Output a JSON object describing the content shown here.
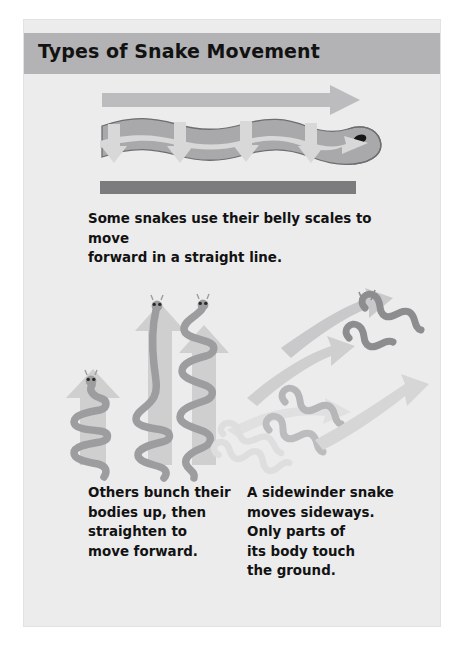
{
  "page": {
    "background_color": "#ececed",
    "outer_background_color": "#ffffff"
  },
  "header": {
    "title": "Types of Snake Movement",
    "band_color": "#b3b3b5",
    "title_color": "#121212"
  },
  "figures": [
    {
      "id": "straight-line-movement",
      "name": "snake-straight-line-diagram",
      "description": "Side view of a snake lying on the ground, with a long horizontal arrow above it pointing right and small arrows along its belly pointing down and right.",
      "snake_body_color": "#a9a9ab",
      "snake_outline_color": "#6e6e70",
      "arrow_color": "#d4d4d5",
      "top_arrow_color": "#bcbcbe",
      "ground_color": "#7c7c7e",
      "eye_color": "#161616"
    },
    {
      "id": "concertina-movement",
      "name": "snake-concertina-diagram",
      "description": "Three snakes of increasing extension, each in front of an upward-pointing arrow, showing bunching up and straightening.",
      "snake_body_color": "#9d9d9f",
      "arrow_color": "#cfcfd0",
      "eye_color": "#2a2a2a"
    },
    {
      "id": "sidewinder-movement",
      "name": "snake-sidewinder-diagram",
      "description": "Three wavy snakes in stepped diagonal positions with broad curved arrows pointing up and to the right.",
      "snake_light_color": "#dcdcdd",
      "snake_mid_color": "#b6b6b8",
      "snake_dark_color": "#8d8d8f",
      "arrow_color": "#d6d6d7"
    }
  ],
  "captions": {
    "straight": "Some snakes use their belly scales to move\nforward in a straight line.",
    "concertina": "Others bunch their\nbodies up, then\nstraighten to\nmove forward.",
    "sidewinder": "A sidewinder snake\nmoves sideways.\nOnly parts of\nits body touch\nthe ground."
  }
}
